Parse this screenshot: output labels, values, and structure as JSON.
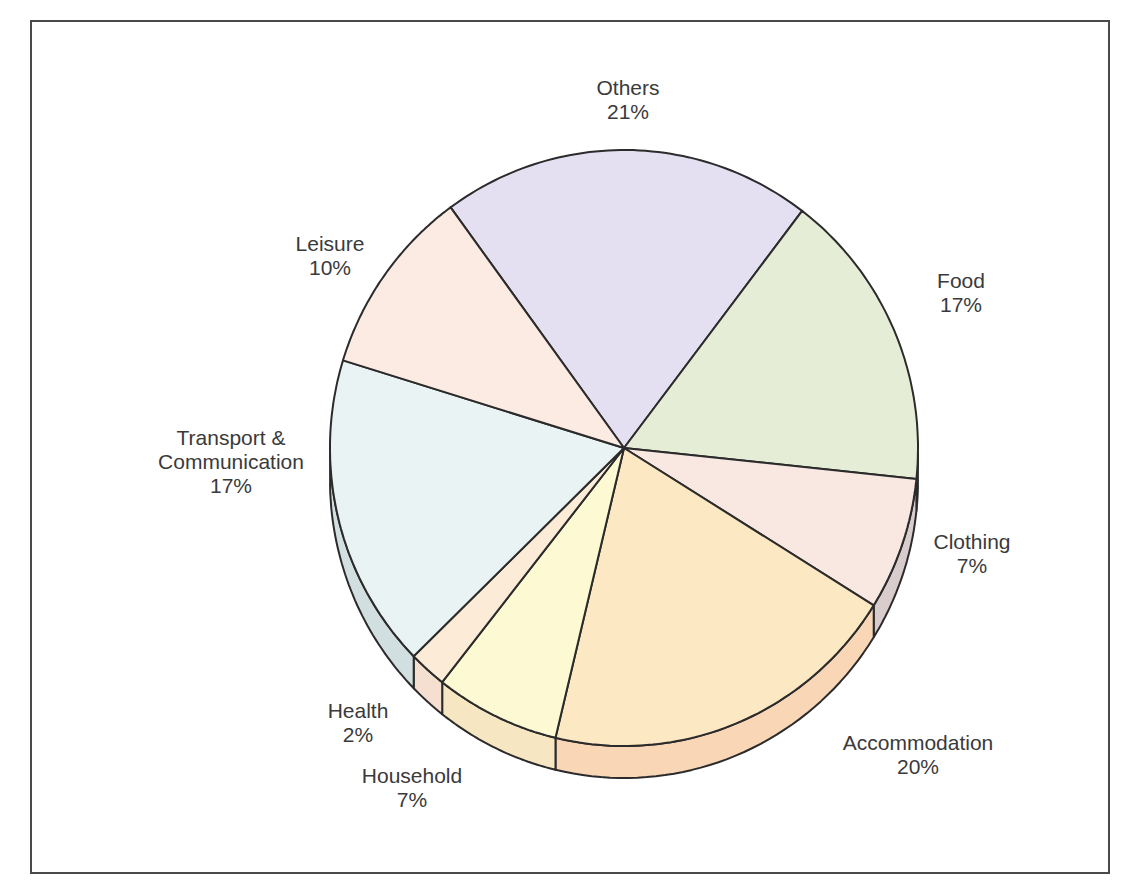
{
  "chart_data": {
    "type": "pie",
    "title": "",
    "style": "3d-pie",
    "slices": [
      {
        "name": "Others",
        "label_lines": [
          "Others"
        ],
        "value": 21,
        "pct_label": "21%",
        "color": "#e4e0f2",
        "side_color": "#cfcae0",
        "start": 451,
        "label_x": 628,
        "label_y": 76
      },
      {
        "name": "Food",
        "label_lines": [
          "Food"
        ],
        "value": 17,
        "pct_label": "17%",
        "color": "#e6edd6",
        "side_color": "#cdd6bb",
        "label_x": 961,
        "label_y": 269
      },
      {
        "name": "Clothing",
        "label_lines": [
          "Clothing"
        ],
        "value": 7,
        "pct_label": "7%",
        "color": "#f9e7e2",
        "side_color": "#d9cccd",
        "label_x": 972,
        "label_y": 530
      },
      {
        "name": "Accommodation",
        "label_lines": [
          "Accommodation"
        ],
        "value": 20,
        "pct_label": "20%",
        "color": "#fce8c2",
        "side_color": "#f8d6b6",
        "label_x": 918,
        "label_y": 731
      },
      {
        "name": "Household",
        "label_lines": [
          "Household"
        ],
        "value": 7,
        "pct_label": "7%",
        "color": "#fdfad3",
        "side_color": "#f7e6c2",
        "label_x": 412,
        "label_y": 764
      },
      {
        "name": "Health",
        "label_lines": [
          "Health"
        ],
        "value": 2,
        "pct_label": "2%",
        "color": "#fcecd7",
        "side_color": "#f5dfd0",
        "label_x": 358,
        "label_y": 699
      },
      {
        "name": "Transport & Communication",
        "label_lines": [
          "Transport &",
          "Communication"
        ],
        "value": 17,
        "pct_label": "17%",
        "color": "#eaf3f3",
        "side_color": "#d2dfe0",
        "label_x": 231,
        "label_y": 426
      },
      {
        "name": "Leisure",
        "label_lines": [
          "Leisure"
        ],
        "value": 10,
        "pct_label": "10%",
        "color": "#fcebe3",
        "side_color": "#eedad2",
        "label_x": 330,
        "label_y": 232
      }
    ],
    "boundary_points": [
      [
        451,
        208
      ],
      [
        802,
        211
      ],
      [
        917,
        479
      ],
      [
        870,
        603
      ],
      [
        555,
        740
      ],
      [
        440,
        685
      ],
      [
        414,
        656
      ],
      [
        345,
        361
      ]
    ],
    "center": [
      624,
      448
    ],
    "rx": 294,
    "ry": 298,
    "depth": 32,
    "outline_color": "#2b2b2b",
    "legend": "none (labels placed around pie)"
  }
}
